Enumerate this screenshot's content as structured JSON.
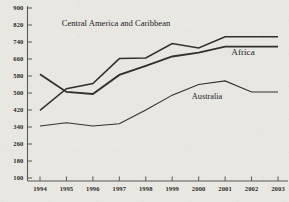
{
  "chart_data": {
    "type": "line",
    "title": "",
    "xlabel": "",
    "ylabel": "",
    "x": [
      1994,
      1995,
      1996,
      1997,
      1998,
      1999,
      2000,
      2001,
      2002,
      2003
    ],
    "xtick_labels": [
      "1994",
      "1995",
      "1996",
      "1997",
      "1998",
      "1999",
      "2000",
      "2001",
      "2002",
      "2003"
    ],
    "ytick_labels": [
      "900",
      "820",
      "740",
      "660",
      "580",
      "500",
      "420",
      "340",
      "260",
      "180",
      "100"
    ],
    "ytick_values": [
      900,
      820,
      740,
      660,
      580,
      500,
      420,
      340,
      260,
      180,
      100
    ],
    "ylim": [
      100,
      900
    ],
    "xlim": [
      1994,
      2003
    ],
    "grid": false,
    "legend_position": "inline-annotations",
    "series": [
      {
        "name": "Central America and Caribbean",
        "label": "Central America and Caribbean",
        "color": "#31302c",
        "values": [
          418,
          520,
          545,
          662,
          665,
          733,
          712,
          765,
          765,
          765
        ]
      },
      {
        "name": "Africa",
        "label": "Africa",
        "color": "#31302c",
        "values": [
          588,
          505,
          495,
          585,
          628,
          672,
          690,
          718,
          718,
          718
        ]
      },
      {
        "name": "Australia",
        "label": "Australia",
        "color": "#31302c",
        "values": [
          345,
          360,
          345,
          355,
          420,
          490,
          540,
          557,
          505,
          505
        ]
      }
    ],
    "annotations": [
      {
        "text": "Central America and Caribbean",
        "series": "Central America and Caribbean"
      },
      {
        "text": "Africa",
        "series": "Africa"
      },
      {
        "text": "Australia",
        "series": "Australia"
      }
    ]
  },
  "axis": {
    "y_ticks": [
      {
        "label": "900"
      },
      {
        "label": "820"
      },
      {
        "label": "740"
      },
      {
        "label": "660"
      },
      {
        "label": "580"
      },
      {
        "label": "500"
      },
      {
        "label": "420"
      },
      {
        "label": "340"
      },
      {
        "label": "260"
      },
      {
        "label": "180"
      },
      {
        "label": "100"
      }
    ],
    "x_ticks": [
      {
        "label": "1994"
      },
      {
        "label": "1995"
      },
      {
        "label": "1996"
      },
      {
        "label": "1997"
      },
      {
        "label": "1998"
      },
      {
        "label": "1999"
      },
      {
        "label": "2000"
      },
      {
        "label": "2001"
      },
      {
        "label": "2002"
      },
      {
        "label": "2003"
      }
    ]
  },
  "colors": {
    "background": "#e9e7e2",
    "axis": "#5a5954",
    "line": "#31302c",
    "text": "#2c2b28"
  }
}
